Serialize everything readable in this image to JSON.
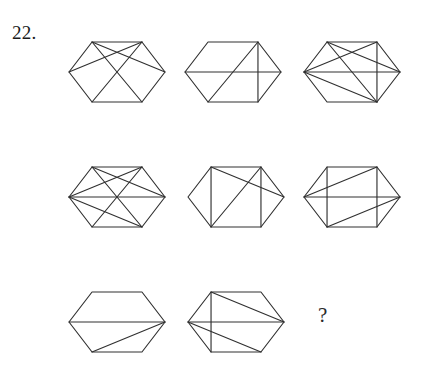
{
  "page": {
    "item_number": "22.",
    "question_mark": "?",
    "background_color": "#ffffff",
    "stroke_color": "#303030"
  },
  "puzzle": {
    "type": "matrix-reasoning",
    "rows": 3,
    "columns": 3,
    "shape": "hexagon",
    "missing_cell": {
      "row": 3,
      "column": 3,
      "label": "?"
    },
    "vertex_names": [
      "top-left",
      "top-right",
      "right",
      "bottom-right",
      "bottom-left",
      "left"
    ],
    "cells": [
      {
        "row": 1,
        "column": 1,
        "name": "cell-r1c1",
        "center": [
          117,
          72
        ],
        "radius_x": 48,
        "radius_y": 50,
        "chords": [
          [
            0,
            2
          ],
          [
            1,
            5
          ],
          [
            0,
            3
          ],
          [
            1,
            4
          ]
        ],
        "chord_count": 4
      },
      {
        "row": 1,
        "column": 2,
        "name": "cell-r1c2",
        "center": [
          233,
          72
        ],
        "radius_x": 48,
        "radius_y": 50,
        "chords": [
          [
            5,
            2
          ],
          [
            1,
            4
          ],
          [
            1,
            3
          ]
        ],
        "chord_count": 3
      },
      {
        "row": 1,
        "column": 3,
        "name": "cell-r1c3",
        "center": [
          352,
          72
        ],
        "radius_x": 48,
        "radius_y": 50,
        "chords": [
          [
            5,
            2
          ],
          [
            0,
            2
          ],
          [
            1,
            5
          ],
          [
            0,
            3
          ],
          [
            1,
            3
          ],
          [
            5,
            3
          ]
        ],
        "chord_count": 6
      },
      {
        "row": 2,
        "column": 1,
        "name": "cell-r2c1",
        "center": [
          117,
          197
        ],
        "radius_x": 48,
        "radius_y": 50,
        "chords": [
          [
            5,
            2
          ],
          [
            0,
            2
          ],
          [
            1,
            5
          ],
          [
            0,
            3
          ],
          [
            1,
            4
          ],
          [
            5,
            3
          ]
        ],
        "chord_count": 6
      },
      {
        "row": 2,
        "column": 2,
        "name": "cell-r2c2",
        "center": [
          236,
          197
        ],
        "radius_x": 48,
        "radius_y": 50,
        "chords": [
          [
            0,
            4
          ],
          [
            1,
            3
          ],
          [
            0,
            2
          ],
          [
            1,
            4
          ]
        ],
        "chord_count": 4
      },
      {
        "row": 2,
        "column": 3,
        "name": "cell-r2c3",
        "center": [
          352,
          197
        ],
        "radius_x": 48,
        "radius_y": 50,
        "chords": [
          [
            5,
            2
          ],
          [
            0,
            4
          ],
          [
            1,
            3
          ],
          [
            5,
            1
          ],
          [
            4,
            2
          ]
        ],
        "chord_count": 5
      },
      {
        "row": 3,
        "column": 1,
        "name": "cell-r3c1",
        "center": [
          117,
          322
        ],
        "radius_x": 48,
        "radius_y": 50,
        "chords": [
          [
            5,
            2
          ],
          [
            4,
            2
          ]
        ],
        "chord_count": 2
      },
      {
        "row": 3,
        "column": 2,
        "name": "cell-r3c2",
        "center": [
          236,
          322
        ],
        "radius_x": 48,
        "radius_y": 50,
        "chords": [
          [
            5,
            2
          ],
          [
            0,
            4
          ],
          [
            0,
            2
          ],
          [
            5,
            3
          ]
        ],
        "chord_count": 4
      },
      {
        "row": 3,
        "column": 3,
        "name": "cell-r3c3-answer",
        "center": [
          352,
          322
        ],
        "radius_x": 48,
        "radius_y": 50,
        "chords": [],
        "chord_count": 0,
        "is_blank": true
      }
    ]
  }
}
